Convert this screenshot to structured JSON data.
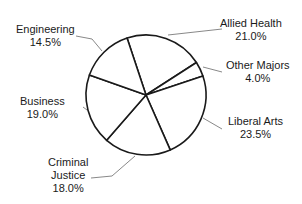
{
  "chart_data": {
    "type": "pie",
    "title": "",
    "categories": [
      "Allied Health",
      "Other Majors",
      "Liberal Arts",
      "Criminal Justice",
      "Business",
      "Engineering"
    ],
    "values": [
      21.0,
      4.0,
      23.5,
      18.0,
      19.0,
      14.5
    ],
    "value_labels": [
      "21.0%",
      "4.0%",
      "23.5%",
      "18.0%",
      "19.0%",
      "14.5%"
    ],
    "start_angle_deg_clockwise_from_top": -18.4,
    "fill_color": "#ffffff",
    "stroke_color": "#1a1a1a",
    "legend": "none (callout labels)"
  },
  "labels": [
    {
      "name": "Allied Health",
      "lines": [
        "Allied Health",
        "21.0%"
      ]
    },
    {
      "name": "Other Majors",
      "lines": [
        "Other Majors",
        "4.0%"
      ]
    },
    {
      "name": "Liberal Arts",
      "lines": [
        "Liberal Arts",
        "23.5%"
      ]
    },
    {
      "name": "Criminal Justice",
      "lines": [
        "Criminal",
        "Justice",
        "18.0%"
      ]
    },
    {
      "name": "Business",
      "lines": [
        "Business",
        "19.0%"
      ]
    },
    {
      "name": "Engineering",
      "lines": [
        "Engineering",
        "14.5%"
      ]
    }
  ]
}
